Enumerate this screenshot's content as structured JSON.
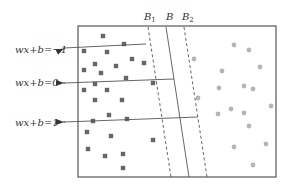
{
  "diagram": {
    "colors": {
      "frame": "#555555",
      "line": "#555555",
      "square": "#666666",
      "circle": "#b5b5b5",
      "text": "#333333"
    },
    "frame": {
      "x": 78,
      "y": 26,
      "width": 198,
      "height": 151
    },
    "hyperplanes": [
      {
        "id": "B1",
        "label": "B",
        "subscript": "1",
        "style": "dashed",
        "top": [
          148,
          27
        ],
        "bottom": [
          171,
          177
        ],
        "label_pos": [
          144,
          20
        ]
      },
      {
        "id": "B",
        "label": "B",
        "subscript": "",
        "style": "solid",
        "top": [
          166,
          27
        ],
        "bottom": [
          189,
          177
        ],
        "label_pos": [
          166,
          20
        ]
      },
      {
        "id": "B2",
        "label": "B",
        "subscript": "2",
        "style": "dashed",
        "top": [
          184,
          27
        ],
        "bottom": [
          207,
          177
        ],
        "label_pos": [
          182,
          20
        ]
      }
    ],
    "annotations": [
      {
        "id": "minus1",
        "text": "wx+b=−1",
        "text_pos": [
          15,
          53
        ],
        "arrow_tip": [
          56,
          49
        ],
        "line_start": [
          64,
          48
        ],
        "line_end": [
          146,
          44
        ]
      },
      {
        "id": "zero",
        "text": "wx+b=0",
        "text_pos": [
          15,
          86
        ],
        "arrow_tip": [
          56,
          83
        ],
        "line_start": [
          64,
          83
        ],
        "line_end": [
          174,
          79
        ]
      },
      {
        "id": "plus1",
        "text": "wx+b=1",
        "text_pos": [
          15,
          126
        ],
        "arrow_tip": [
          56,
          122
        ],
        "line_start": [
          64,
          122
        ],
        "line_end": [
          198,
          117
        ]
      }
    ],
    "class_squares": [
      [
        103,
        36
      ],
      [
        124,
        44
      ],
      [
        84,
        51
      ],
      [
        107,
        52
      ],
      [
        132,
        59
      ],
      [
        144,
        63
      ],
      [
        95,
        64
      ],
      [
        116,
        66
      ],
      [
        84,
        70
      ],
      [
        101,
        73
      ],
      [
        126,
        78
      ],
      [
        153,
        83
      ],
      [
        95,
        84
      ],
      [
        84,
        90
      ],
      [
        107,
        90
      ],
      [
        95,
        100
      ],
      [
        122,
        100
      ],
      [
        109,
        115
      ],
      [
        93,
        121
      ],
      [
        127,
        119
      ],
      [
        87,
        132
      ],
      [
        111,
        136
      ],
      [
        153,
        140
      ],
      [
        88,
        149
      ],
      [
        105,
        156
      ],
      [
        123,
        154
      ],
      [
        123,
        168
      ]
    ],
    "class_circles": [
      [
        234,
        45
      ],
      [
        249,
        50
      ],
      [
        194,
        59
      ],
      [
        222,
        71
      ],
      [
        260,
        67
      ],
      [
        219,
        88
      ],
      [
        244,
        86
      ],
      [
        253,
        89
      ],
      [
        198,
        98
      ],
      [
        218,
        114
      ],
      [
        231,
        109
      ],
      [
        244,
        113
      ],
      [
        271,
        106
      ],
      [
        249,
        126
      ],
      [
        234,
        147
      ],
      [
        266,
        144
      ],
      [
        253,
        165
      ]
    ]
  }
}
